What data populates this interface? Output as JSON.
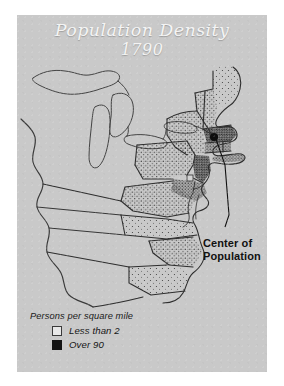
{
  "figure": {
    "title_main": "Population Density",
    "title_year": "1790",
    "background_color": "#c9c9c9",
    "page_color": "#ffffff",
    "title_color": "#f4f4f4"
  },
  "annotations": {
    "center_of_population": {
      "line1": "Center of",
      "line2": "Population",
      "marker": "black-dot"
    }
  },
  "legend": {
    "title": "Persons per square mile",
    "items": [
      {
        "label": "Less than 2",
        "swatch": "light",
        "color": "#e8e8e8"
      },
      {
        "label": "Over 90",
        "swatch": "dark",
        "color": "#141414"
      }
    ]
  },
  "map": {
    "region": "eastern-united-states-1790",
    "coastline_color": "#3a3a3a",
    "border_color": "#2e2e2e",
    "stipple_color": "#2a2a2a"
  }
}
